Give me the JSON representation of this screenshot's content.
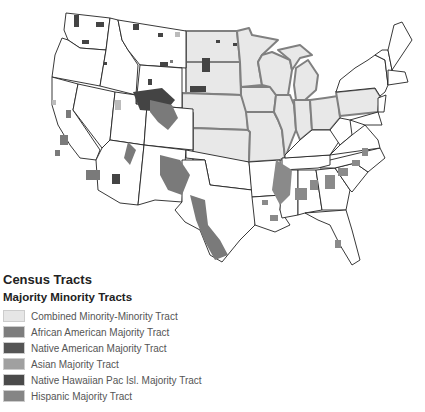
{
  "map": {
    "description": "Map of contiguous United States showing majority minority census tracts; Midwest region states highlighted",
    "highlighted_region_fill": "#e8e8e8",
    "highlighted_region_border": "#808080",
    "state_border_color": "#222222"
  },
  "legend": {
    "title": "Census Tracts",
    "subtitle": "Majority Minority Tracts",
    "items": [
      {
        "label": "Combined Minority-Minority Tract",
        "color": "#e6e6e6"
      },
      {
        "label": "African American Majority Tract",
        "color": "#7d7d7d"
      },
      {
        "label": "Native American Majority Tract",
        "color": "#555555"
      },
      {
        "label": "Asian Majority Tract",
        "color": "#a0a0a0"
      },
      {
        "label": "Native Hawaiian Pac Isl. Majority Tract",
        "color": "#4a4a4a"
      },
      {
        "label": "Hispanic Majority Tract",
        "color": "#858585"
      }
    ]
  },
  "footer": {
    "cutoff_text": ". . . . . . . . . . . . . . ."
  }
}
